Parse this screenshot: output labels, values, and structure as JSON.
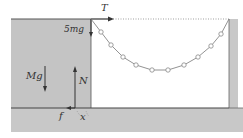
{
  "labels": {
    "tension": "T",
    "weight_chain": "5mg",
    "weight_block": "Mg",
    "normal": "N",
    "friction": "f",
    "distance": "x"
  },
  "colors": {
    "block": "#c4c4c4",
    "floor": "#c8c8c8",
    "line": "#555555",
    "bead": "#999999"
  },
  "chain": {
    "beads": [
      [
        101,
        32
      ],
      [
        111,
        45
      ],
      [
        123,
        57
      ],
      [
        136,
        65
      ],
      [
        152,
        70
      ],
      [
        168,
        70
      ],
      [
        184,
        65
      ],
      [
        198,
        57
      ],
      [
        211,
        46
      ],
      [
        221,
        34
      ]
    ]
  }
}
